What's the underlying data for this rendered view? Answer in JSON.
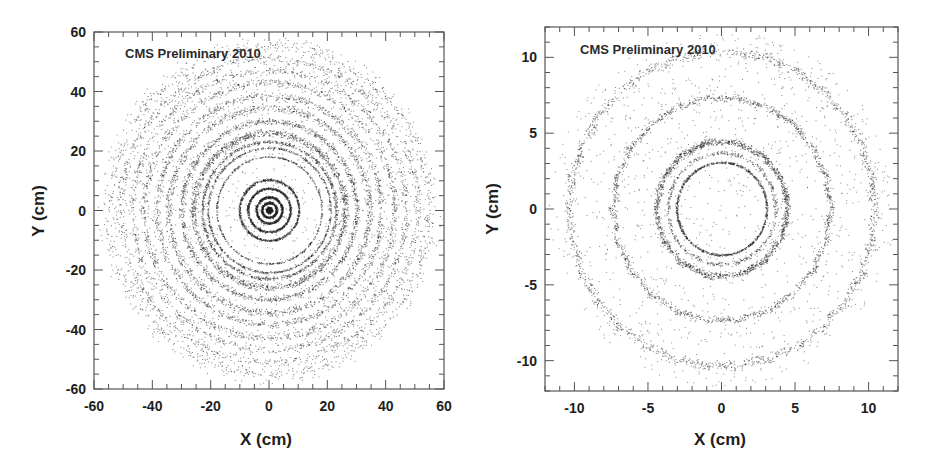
{
  "chart_data": [
    {
      "type": "scatter",
      "title": "",
      "annotation": "CMS Preliminary 2010",
      "xlabel": "X (cm)",
      "ylabel": "Y (cm)",
      "xlim": [
        -60,
        60
      ],
      "ylim": [
        -60,
        60
      ],
      "x_ticks": [
        "-60",
        "-40",
        "-20",
        "0",
        "20",
        "40",
        "60"
      ],
      "y_ticks": [
        "60",
        "40",
        "20",
        "0",
        "-20",
        "-40",
        "-60"
      ],
      "grid": false,
      "legend": null,
      "description": "Density of reconstructed secondary vertices (photon conversions/nuclear interactions) in transverse plane showing concentric tracker layers",
      "rings_radius_cm": [
        4.4,
        7.3,
        10.2,
        21,
        23,
        26,
        30,
        34,
        38,
        43,
        47,
        51,
        55
      ]
    },
    {
      "type": "scatter",
      "title": "",
      "annotation": "CMS Preliminary 2010",
      "xlabel": "X (cm)",
      "ylabel": "Y (cm)",
      "xlim": [
        -12,
        12
      ],
      "ylim": [
        -12,
        12
      ],
      "x_ticks": [
        "-10",
        "-5",
        "0",
        "5",
        "10"
      ],
      "y_ticks": [
        "10",
        "5",
        "0",
        "-5",
        "-10"
      ],
      "grid": false,
      "legend": null,
      "description": "Zoom of pixel detector region showing beam pipe and three pixel barrel layers with module-structure modulation",
      "rings_radius_cm": [
        3.0,
        4.4,
        7.3,
        10.2
      ]
    }
  ]
}
